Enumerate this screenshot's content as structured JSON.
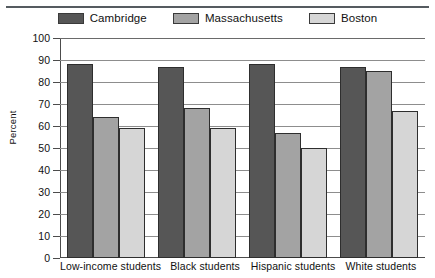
{
  "chart_data": {
    "type": "bar",
    "title": "",
    "xlabel": "",
    "ylabel": "Percent",
    "ylim": [
      0,
      100
    ],
    "ytick_step": 10,
    "yticks": [
      100,
      90,
      80,
      70,
      60,
      50,
      40,
      30,
      20,
      10,
      0
    ],
    "grid": true,
    "legend_position": "top-center",
    "categories": [
      "Low-income students",
      "Black students",
      "Hispanic students",
      "White students"
    ],
    "series": [
      {
        "name": "Cambridge",
        "color": "#565656",
        "values": [
          88,
          87,
          88,
          87
        ]
      },
      {
        "name": "Massachusetts",
        "color": "#a3a3a3",
        "values": [
          64,
          68,
          57,
          85
        ]
      },
      {
        "name": "Boston",
        "color": "#d6d6d6",
        "values": [
          59,
          59,
          50,
          67
        ]
      }
    ]
  },
  "legend": {
    "items": [
      {
        "label": "Cambridge"
      },
      {
        "label": "Massachusetts"
      },
      {
        "label": "Boston"
      }
    ]
  }
}
